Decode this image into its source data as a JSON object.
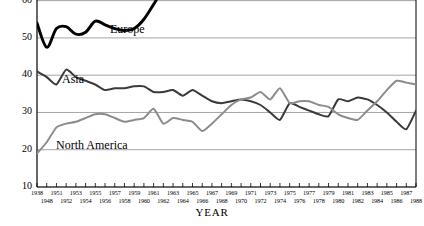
{
  "chart_data": {
    "type": "line",
    "title": "",
    "xlabel": "YEAR",
    "ylabel": "Intra-Regional Exports/ Total Exports",
    "ylim": [
      10,
      65
    ],
    "yticks": [
      10,
      20,
      30,
      40,
      50,
      60
    ],
    "grid": "horizontal",
    "legend": "inline-annotations",
    "x": [
      1938,
      1948,
      1951,
      1952,
      1953,
      1954,
      1955,
      1956,
      1957,
      1958,
      1959,
      1960,
      1961,
      1962,
      1963,
      1964,
      1965,
      1966,
      1967,
      1968,
      1969,
      1970,
      1971,
      1972,
      1973,
      1974,
      1975,
      1976,
      1977,
      1978,
      1979,
      1980,
      1981,
      1982,
      1983,
      1984,
      1985,
      1986,
      1987,
      1988
    ],
    "xtick_labels_top": [
      "1938",
      "1951",
      "1953",
      "1955",
      "1957",
      "1959",
      "1961",
      "1963",
      "1965",
      "1967",
      "1969",
      "1971",
      "1973",
      "1975",
      "1977",
      "1979",
      "1981",
      "1983",
      "1985",
      "1987"
    ],
    "xtick_labels_bottom": [
      "1948",
      "1952",
      "1954",
      "1956",
      "1958",
      "1960",
      "1962",
      "1964",
      "1966",
      "1968",
      "1970",
      "1972",
      "1974",
      "1976",
      "1978",
      "1980",
      "1982",
      "1984",
      "1986",
      "1988"
    ],
    "series": [
      {
        "name": "Europe",
        "color": "#000000",
        "label_x": 110,
        "label_y": 22,
        "values": [
          54.0,
          47.5,
          52.5,
          53.0,
          51.0,
          51.5,
          54.5,
          53.5,
          52.5,
          52.0,
          52.5,
          55.0,
          59.0,
          63.0,
          64.5,
          64.8,
          64.7,
          64.5,
          64.3,
          65.8,
          66.0,
          67.0,
          68.0,
          69.5,
          69.0,
          66.5,
          67.5,
          66.0,
          68.0,
          67.5,
          66.0,
          65.2,
          65.0,
          64.8,
          64.5,
          65.5,
          67.5,
          69.5,
          70.5,
          71.0
        ]
      },
      {
        "name": "Asia",
        "color": "#3a3a3a",
        "label_x": 62,
        "label_y": 72,
        "values": [
          41.0,
          39.5,
          37.5,
          41.5,
          39.5,
          38.5,
          37.5,
          36.0,
          36.5,
          36.5,
          37.0,
          37.0,
          35.5,
          35.5,
          36.0,
          34.5,
          36.0,
          34.5,
          33.0,
          32.5,
          33.0,
          33.5,
          33.0,
          32.0,
          30.0,
          28.0,
          32.5,
          31.5,
          30.5,
          29.5,
          29.0,
          33.5,
          33.0,
          34.0,
          33.5,
          32.0,
          30.0,
          27.5,
          25.5,
          30.5
        ]
      },
      {
        "name": "North America",
        "color": "#8c8c8c",
        "label_x": 56,
        "label_y": 138,
        "values": [
          19.0,
          22.0,
          26.0,
          27.0,
          27.5,
          28.5,
          29.5,
          29.5,
          28.5,
          27.5,
          28.0,
          28.5,
          31.0,
          27.0,
          28.5,
          28.0,
          27.5,
          25.0,
          27.0,
          29.5,
          32.0,
          33.5,
          34.0,
          35.5,
          33.5,
          36.5,
          32.5,
          33.0,
          33.0,
          32.0,
          31.5,
          29.5,
          28.5,
          28.0,
          30.5,
          33.0,
          36.0,
          38.5,
          38.0,
          37.5
        ]
      }
    ]
  }
}
